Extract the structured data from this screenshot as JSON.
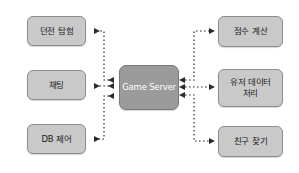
{
  "diagram": {
    "colors": {
      "node_fill": "#c9c9c9",
      "node_border": "#8d8d8d",
      "center_fill": "#9b9b9b",
      "center_border": "#7a7a7a",
      "center_text": "#ffffff",
      "edge": "#2b2b2b",
      "background": "#ffffff"
    },
    "center": {
      "label": "Game Server"
    },
    "left_nodes": [
      {
        "label": "던전 탐험"
      },
      {
        "label": "채팅"
      },
      {
        "label": "DB 제어"
      }
    ],
    "right_nodes": [
      {
        "label": "점수 계산"
      },
      {
        "label": "유저 데이터\n처리"
      },
      {
        "label": "친구 찾기"
      }
    ],
    "edges": [
      {
        "from": "Game Server",
        "to": "던전 탐험",
        "style": "dotted",
        "arrows": "both"
      },
      {
        "from": "Game Server",
        "to": "채팅",
        "style": "dotted",
        "arrows": "both"
      },
      {
        "from": "Game Server",
        "to": "DB 제어",
        "style": "dotted",
        "arrows": "both"
      },
      {
        "from": "Game Server",
        "to": "점수 계산",
        "style": "dotted",
        "arrows": "both"
      },
      {
        "from": "Game Server",
        "to": "유저 데이터 처리",
        "style": "dotted",
        "arrows": "both"
      },
      {
        "from": "Game Server",
        "to": "친구 찾기",
        "style": "dotted",
        "arrows": "both"
      }
    ]
  }
}
